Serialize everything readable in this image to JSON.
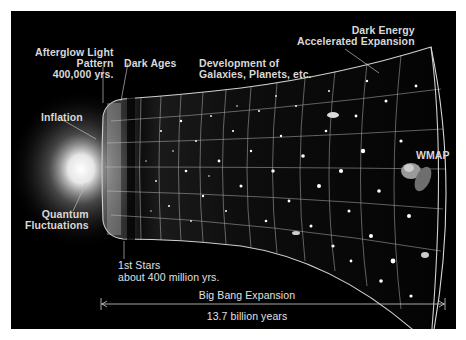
{
  "diagram": {
    "labels": {
      "afterglow": [
        "Afterglow Light",
        "Pattern",
        "400,000 yrs."
      ],
      "dark_ages": "Dark Ages",
      "development": [
        "Development of",
        "Galaxies, Planets, etc."
      ],
      "dark_energy": [
        "Dark Energy",
        "Accelerated Expansion"
      ],
      "inflation": "Inflation",
      "wmap": "WMAP",
      "quantum": [
        "Quantum",
        "Fluctuations"
      ],
      "first_stars": [
        "1st Stars",
        "about 400 million yrs."
      ],
      "expansion": "Big Bang Expansion",
      "duration": "13.7 billion years"
    },
    "colors": {
      "background": "#000000",
      "border": "#ffffff",
      "text": "#d8d8d8",
      "grid": "#cfcfcf"
    }
  }
}
